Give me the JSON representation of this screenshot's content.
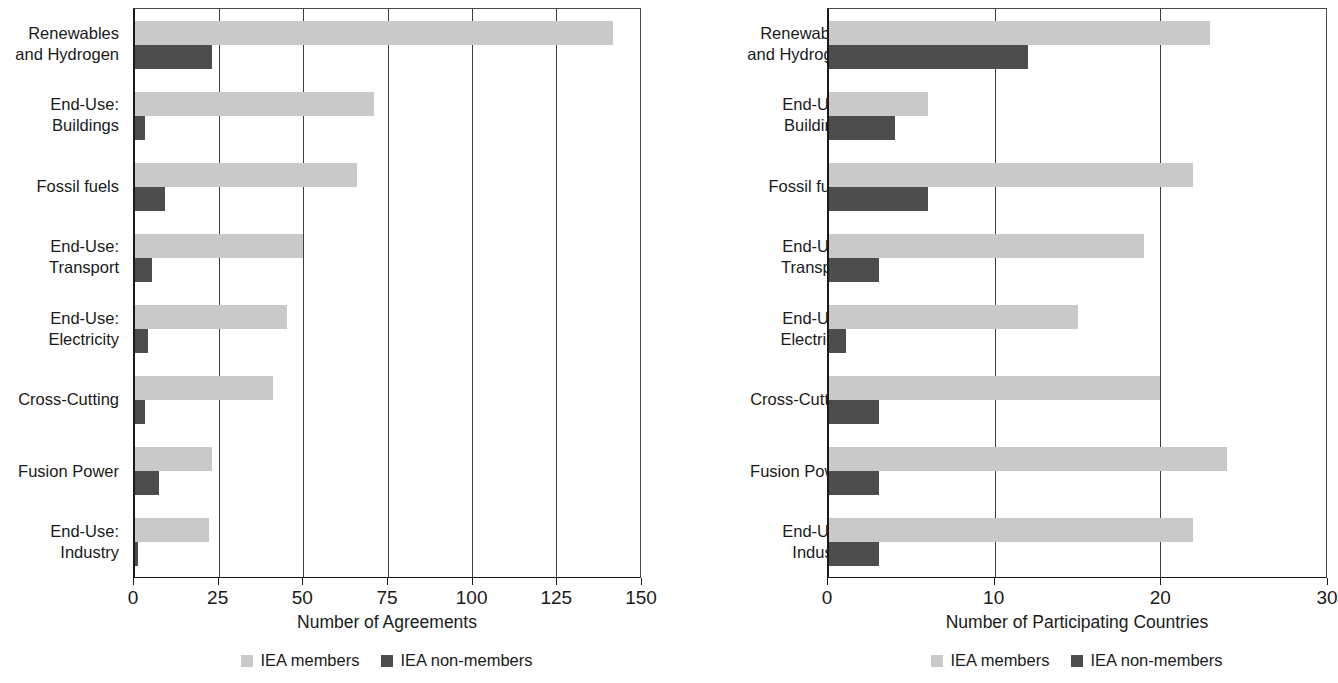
{
  "chart_data": [
    {
      "type": "bar",
      "orientation": "horizontal",
      "title": "",
      "xlabel": "Number of Agreements",
      "ylabel": "",
      "xlim": [
        0,
        150
      ],
      "xticks": [
        0,
        25,
        50,
        75,
        100,
        125,
        150
      ],
      "xtick_labels": [
        "0",
        "25",
        "50",
        "75",
        "100",
        "125",
        "150"
      ],
      "grid": true,
      "legend_position": "bottom",
      "categories": [
        "Renewables and Hydrogen",
        "End-Use: Buildings",
        "Fossil fuels",
        "End-Use: Transport",
        "End-Use: Electricity",
        "Cross-Cutting",
        "Fusion Power",
        "End-Use: Industry"
      ],
      "series": [
        {
          "name": "IEA members",
          "color": "#c9c9c9",
          "values": [
            142,
            71,
            66,
            50,
            45,
            41,
            23,
            22
          ]
        },
        {
          "name": "IEA non-members",
          "color": "#4d4d4d",
          "values": [
            23,
            3,
            9,
            5,
            4,
            3,
            7,
            1
          ]
        }
      ]
    },
    {
      "type": "bar",
      "orientation": "horizontal",
      "title": "",
      "xlabel": "Number of Participating Countries",
      "ylabel": "",
      "xlim": [
        0,
        30
      ],
      "xticks": [
        0,
        10,
        20,
        30
      ],
      "xtick_labels": [
        "0",
        "10",
        "20",
        "30"
      ],
      "grid": true,
      "legend_position": "bottom",
      "categories": [
        "Renewables and Hydrogen",
        "End-Use: Buildings",
        "Fossil fuels",
        "End-Use: Transport",
        "End-Use: Electricity",
        "Cross-Cutting",
        "Fusion Power",
        "End-Use: Industry"
      ],
      "series": [
        {
          "name": "IEA members",
          "color": "#c9c9c9",
          "values": [
            23,
            6,
            22,
            19,
            15,
            20,
            24,
            22
          ]
        },
        {
          "name": "IEA non-members",
          "color": "#4d4d4d",
          "values": [
            12,
            4,
            6,
            3,
            1,
            3,
            3,
            3
          ]
        }
      ]
    }
  ],
  "left_chart": {
    "categories": [
      {
        "line1": "Renewables",
        "line2": "and Hydrogen"
      },
      {
        "line1": "End-Use:",
        "line2": "Buildings"
      },
      {
        "line1": "Fossil fuels",
        "line2": ""
      },
      {
        "line1": "End-Use:",
        "line2": "Transport"
      },
      {
        "line1": "End-Use:",
        "line2": "Electricity"
      },
      {
        "line1": "Cross-Cutting",
        "line2": ""
      },
      {
        "line1": "Fusion Power",
        "line2": ""
      },
      {
        "line1": "End-Use:",
        "line2": "Industry"
      }
    ],
    "axis_title": "Number of Agreements",
    "xtick_labels": [
      "0",
      "25",
      "50",
      "75",
      "100",
      "125",
      "150"
    ],
    "legend": [
      {
        "label": "IEA members"
      },
      {
        "label": "IEA non-members"
      }
    ]
  },
  "right_chart": {
    "categories": [
      {
        "line1": "Renewables",
        "line2": "and Hydrogen"
      },
      {
        "line1": "End-Use:",
        "line2": "Buildings"
      },
      {
        "line1": "Fossil fuels",
        "line2": ""
      },
      {
        "line1": "End-Use:",
        "line2": "Transport"
      },
      {
        "line1": "End-Use:",
        "line2": "Electricity"
      },
      {
        "line1": "Cross-Cutting",
        "line2": ""
      },
      {
        "line1": "Fusion Power",
        "line2": ""
      },
      {
        "line1": "End-Use:",
        "line2": "Industry"
      }
    ],
    "axis_title": "Number of Participating Countries",
    "xtick_labels": [
      "0",
      "10",
      "20",
      "30"
    ],
    "legend": [
      {
        "label": "IEA members"
      },
      {
        "label": "IEA non-members"
      }
    ]
  }
}
